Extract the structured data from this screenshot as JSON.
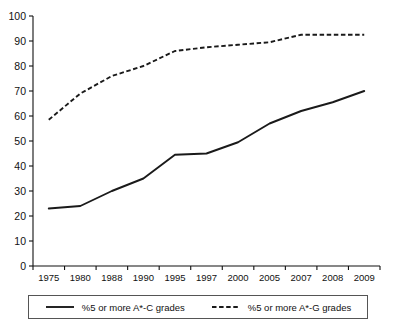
{
  "chart_data": {
    "type": "line",
    "title": "",
    "xlabel": "",
    "ylabel": "",
    "ylim": [
      0,
      100
    ],
    "ytick_step": 10,
    "grid": false,
    "legend_position": "bottom",
    "categories": [
      "1975",
      "1980",
      "1988",
      "1990",
      "1995",
      "1997",
      "2000",
      "2005",
      "2007",
      "2008",
      "2009"
    ],
    "yticks": [
      "0",
      "10",
      "20",
      "30",
      "40",
      "50",
      "60",
      "70",
      "80",
      "90",
      "100"
    ],
    "series": [
      {
        "name": "%5 or more A*-C grades",
        "style": "solid",
        "color": "#1a1a1a",
        "values": [
          23,
          24,
          30,
          35,
          44.5,
          45,
          49.5,
          57,
          62,
          65.5,
          70
        ]
      },
      {
        "name": "%5 or more A*-G grades",
        "style": "dashed",
        "color": "#1a1a1a",
        "values": [
          58.5,
          69,
          76,
          80,
          86,
          87.5,
          88.5,
          89.5,
          92.5,
          92.5,
          92.5
        ]
      }
    ]
  },
  "legend": {
    "entries": [
      {
        "label": "%5 or more A*-C grades",
        "style": "solid"
      },
      {
        "label": "%5 or more A*-G grades",
        "style": "dashed"
      }
    ]
  }
}
